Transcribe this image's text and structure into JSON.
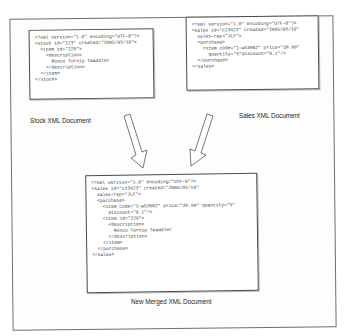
{
  "diagram": {
    "stock_doc": {
      "caption": "Stock XML Document",
      "code": "<?xml version=\"1.0\" encoding=\"UTF-8\"?>\n<stock id=\"123\" created=\"2005/05/10\">\n  <item id=\"229\">\n    <description>\n      Ronco Turnip Twaddler\n    </description>\n  </item>\n</stock>"
    },
    "sales_doc": {
      "caption": "Sales XML Document",
      "code": "<?xml version=\"1.0\" encoding=\"UTF-8\"?>\n<sales id=\"c23423\" created=\"2005/05/10\"\n  sales-rep=\"JLF\">\n  <purchase>\n    <item code=\"1-w53982\" price=\"39.99\"\n      quantity=\"5\"discount=\"0.1\"/>\n  </purchase>\n</sales>"
    },
    "merged_doc": {
      "caption": "New Merged XML Document",
      "code": "<?xml version=\"1.0\" encoding=\"UTF-8\"?>\n<sales id=\"c23423\" created=\"2005/05/10\"\n  sales-rep=\"JLF\">\n  <purchase>\n    <item code=\"1-w53982\" price=\"39.99\" quantity=\"5\"\n      discount=\"0.1\"/>\n    <item id=\"229\">\n      <description>\n        Ronco Turnip Twaddler\n      </description>\n    </item>\n  </purchase>\n</sales>"
    },
    "arrows": [
      {
        "from": "stock_doc",
        "to": "merged_doc",
        "icon": "down-right-arrow-icon"
      },
      {
        "from": "sales_doc",
        "to": "merged_doc",
        "icon": "down-left-arrow-icon"
      }
    ],
    "colors": {
      "border": "#4a4a4a",
      "frame": "#6f6f6f",
      "text": "#333333"
    }
  }
}
